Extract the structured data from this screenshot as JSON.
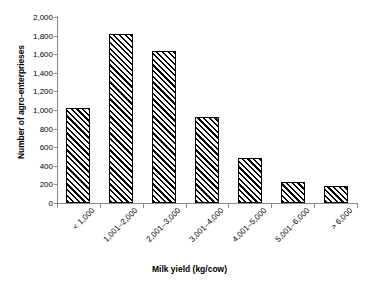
{
  "chart_data": {
    "type": "bar",
    "title": "",
    "xlabel": "Milk yield (kg/cow)",
    "ylabel": "Number of agro-enterprieses",
    "categories": [
      "< 1,000",
      "1,001–2,000",
      "2,001–3,000",
      "3,001–4,000",
      "4,001–5,000",
      "5,001–6,000",
      "> 6,000"
    ],
    "values": [
      1020,
      1820,
      1630,
      930,
      480,
      225,
      180
    ],
    "ylim": [
      0,
      2000
    ],
    "ytick_values": [
      0,
      200,
      400,
      600,
      800,
      1000,
      1200,
      1400,
      1600,
      1800,
      2000
    ],
    "ytick_labels": [
      "0",
      "200",
      "400",
      "600",
      "800",
      "1,000",
      "1,200",
      "1,400",
      "1,600",
      "1,800",
      "2,000"
    ],
    "grid": false,
    "legend": false,
    "bar_fill": "hatch-diagonal-forward",
    "bar_color": "#000000",
    "background": "#ffffff",
    "axis_color": "#8a8a8a"
  }
}
